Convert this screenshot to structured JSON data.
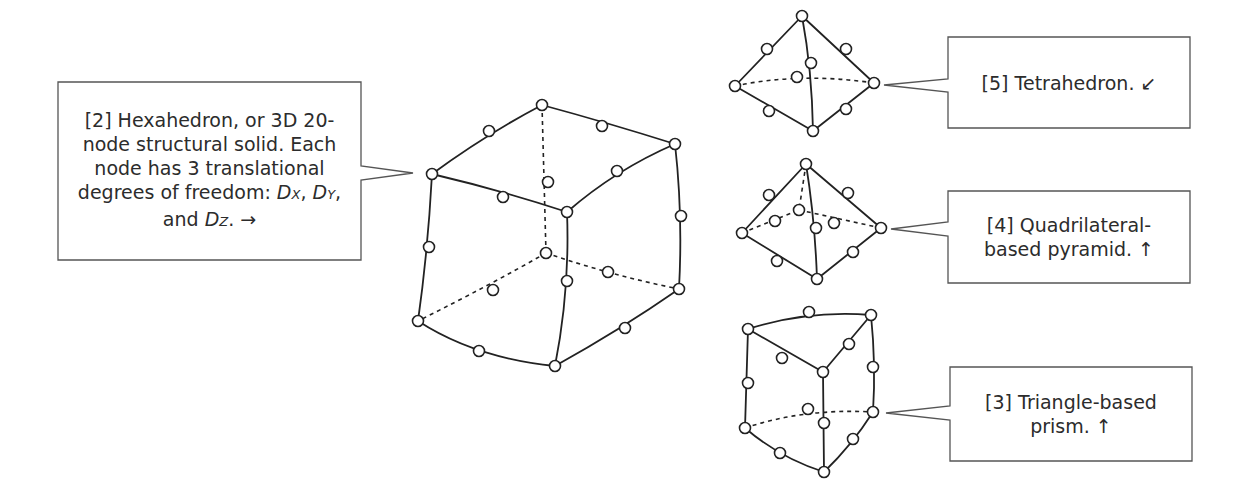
{
  "callouts": {
    "hexahedron": {
      "line1": "[2] Hexahedron, or 3D 20-",
      "line2": "node structural solid.  Each",
      "line3": "node has 3 translational",
      "line4_prefix": "degrees of freedom: ",
      "dx_D": "D",
      "dx_sub": "X",
      "sep1": ", ",
      "dy_D": "D",
      "dy_sub": "Y",
      "sep2": ",",
      "line5_prefix": "and ",
      "dz_D": "D",
      "dz_sub": "Z",
      "line5_suffix": ".  →"
    },
    "tetrahedron": {
      "line1": "[5] Tetrahedron.  ↙"
    },
    "pyramid": {
      "line1": "[4] Quadrilateral-",
      "line2": "based pyramid.  ↑"
    },
    "prism": {
      "line1": "[3] Triangle-based",
      "line2": "prism.  ↑"
    }
  },
  "shapes": [
    {
      "name": "hexahedron",
      "nodes": 20
    },
    {
      "name": "tetrahedron",
      "nodes": 10
    },
    {
      "name": "quadrilateral-based-pyramid",
      "nodes": 13
    },
    {
      "name": "triangle-based-prism",
      "nodes": 15
    }
  ],
  "colors": {
    "line": "#222222",
    "frame": "#555555",
    "text": "#2c2c2c",
    "background": "#ffffff"
  }
}
